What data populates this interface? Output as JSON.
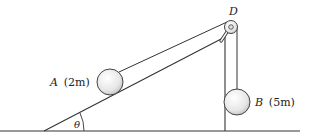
{
  "diagram": {
    "labels": {
      "pulley": "D",
      "block_a_name": "A",
      "block_a_mass": "(2m)",
      "block_b_name": "B",
      "block_b_mass": "(5m)",
      "angle": "θ"
    },
    "colors": {
      "line": "#333333",
      "ball_fill": "#e8e8e8",
      "ball_stroke": "#444444"
    }
  }
}
